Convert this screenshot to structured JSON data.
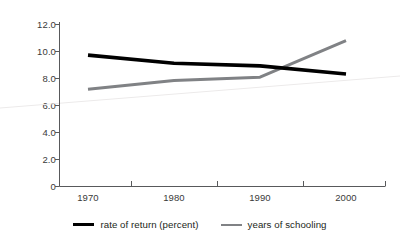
{
  "chart_data": {
    "type": "line",
    "title": "",
    "subtitle": "",
    "xlabel": "",
    "ylabel": "",
    "x": [
      1970,
      1980,
      1990,
      2000
    ],
    "xlim": [
      1965,
      2005
    ],
    "ylim": [
      0,
      12
    ],
    "grid": false,
    "legend_position": "bottom-center",
    "yticks": [
      "0",
      "2.0",
      "4.0",
      "6.0",
      "8.0",
      "10.0",
      "12.0"
    ],
    "ytick_values": [
      0,
      2.0,
      4.0,
      6.0,
      8.0,
      10.0,
      12.0
    ],
    "xticks": [
      "1970",
      "1980",
      "1990",
      "2000"
    ],
    "series": [
      {
        "name": "rate of return (percent)",
        "color": "#000000",
        "values": [
          9.7,
          9.1,
          8.9,
          8.3
        ]
      },
      {
        "name": "years of schooling",
        "color": "#808285",
        "values": [
          7.2,
          7.85,
          8.1,
          10.8
        ]
      }
    ],
    "annotations": []
  },
  "legend": {
    "entries": [
      {
        "label": "rate of return (percent)",
        "swatch": "series-black"
      },
      {
        "label": "years of schooling",
        "swatch": "series-gray"
      }
    ]
  }
}
